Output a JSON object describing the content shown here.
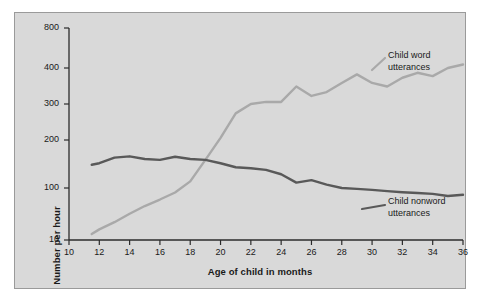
{
  "chart_data": {
    "type": "line",
    "title": "",
    "xlabel": "Age of child in months",
    "ylabel": "Number per hour",
    "xlim": [
      10,
      36
    ],
    "ylim": [
      10,
      800
    ],
    "yscale": "log-like",
    "grid": false,
    "legend_position": "inline-right",
    "xticks": [
      10,
      12,
      14,
      16,
      18,
      20,
      22,
      24,
      26,
      28,
      30,
      32,
      34,
      36
    ],
    "xtick_labels": [
      "10",
      "12",
      "14",
      "16",
      "18",
      "20",
      "22",
      "24",
      "26",
      "28",
      "30",
      "32",
      "34",
      "36"
    ],
    "yticks": [
      10,
      100,
      200,
      300,
      400,
      800
    ],
    "ytick_labels": [
      "10",
      "100",
      "200",
      "300",
      "400",
      "800"
    ],
    "series": [
      {
        "name": "Child word utterances",
        "label_lines": [
          "Child word",
          "utterances"
        ],
        "color": "#a9a9a9",
        "x": [
          11.5,
          12,
          13,
          14,
          15,
          16,
          17,
          18,
          19,
          20,
          21,
          22,
          23,
          24,
          25,
          26,
          27,
          28,
          29,
          30,
          31,
          32,
          33,
          34,
          35,
          36
        ],
        "values": [
          13,
          16,
          22,
          32,
          45,
          60,
          82,
          110,
          150,
          205,
          270,
          300,
          305,
          305,
          345,
          320,
          330,
          355,
          380,
          355,
          345,
          370,
          385,
          375,
          400,
          425
        ]
      },
      {
        "name": "Child nonword utterances",
        "label_lines": [
          "Child nonword",
          "utterances"
        ],
        "color": "#595959",
        "x": [
          11.5,
          12,
          13,
          14,
          15,
          16,
          17,
          18,
          19,
          20,
          21,
          22,
          23,
          24,
          25,
          26,
          27,
          28,
          29,
          30,
          31,
          32,
          33,
          34,
          35,
          36
        ],
        "values": [
          140,
          143,
          155,
          158,
          152,
          150,
          157,
          152,
          150,
          143,
          135,
          133,
          130,
          122,
          108,
          112,
          105,
          100,
          96,
          92,
          87,
          83,
          80,
          77,
          70,
          74
        ]
      }
    ]
  }
}
